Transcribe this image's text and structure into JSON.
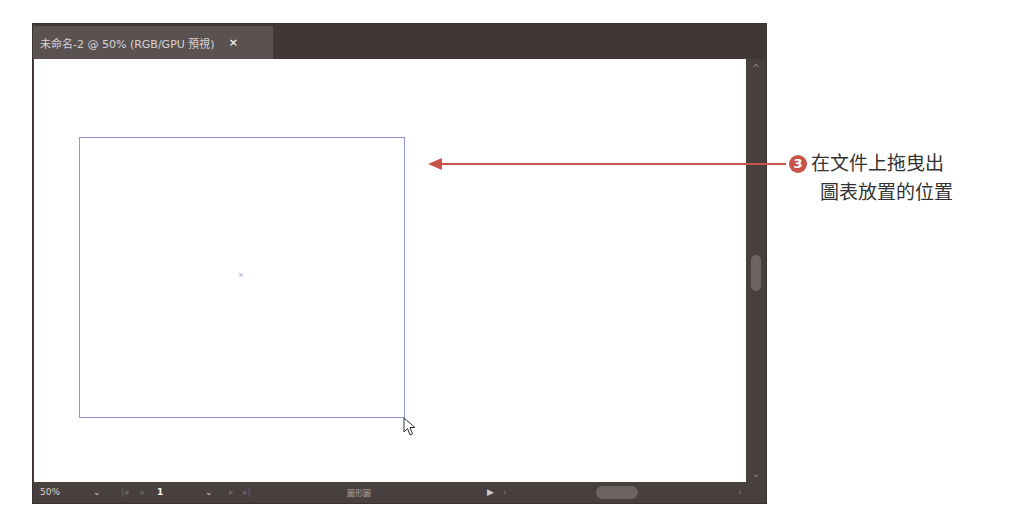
{
  "document": {
    "tab_title": "未命名-2 @ 50% (RGB/GPU 預視)",
    "close_icon": "×"
  },
  "statusbar": {
    "zoom": "50%",
    "zoom_dropdown": "⌄",
    "first_page": "|◂",
    "prev_page": "◂",
    "page": "1",
    "page_dropdown": "⌄",
    "next_page": "▸",
    "last_page": "▸|",
    "tool_label": "圖形圖",
    "play": "▶",
    "scroll_left": "‹",
    "scroll_right": "›"
  },
  "scrollbar": {
    "up": "^",
    "down": "⌄"
  },
  "canvas": {
    "center_mark": "×"
  },
  "annotation": {
    "step_number": "3",
    "line1": "在文件上拖曳出",
    "line2": "圖表放置的位置",
    "color": "#c8534a"
  }
}
